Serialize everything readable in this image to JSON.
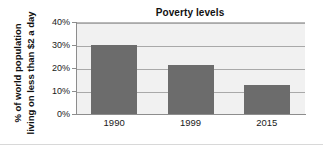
{
  "chart_data": {
    "type": "bar",
    "title": "Poverty levels",
    "xlabel": "",
    "ylabel": "% of world population living on less than $2 a day",
    "ylabel_line1": "% of world population",
    "ylabel_line2": "living on less than $2 a day",
    "categories": [
      "1990",
      "1999",
      "2015"
    ],
    "values": [
      30,
      21.5,
      12.5
    ],
    "ylim": [
      0,
      40
    ],
    "yticks": [
      0,
      10,
      20,
      30,
      40
    ],
    "ytick_labels": [
      "0%",
      "10%",
      "20%",
      "30%",
      "40%"
    ],
    "grid": true,
    "legend": false,
    "bar_color": "#6c6c6c",
    "plot_background": "#f1f1f1",
    "gridline_color": "#a9a9a9",
    "axis_color": "#8d8d8d",
    "text_color": "#1a1a1a"
  }
}
